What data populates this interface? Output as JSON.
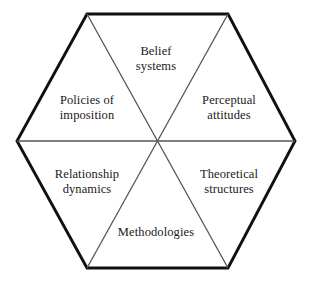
{
  "diagram": {
    "type": "hexagon-sector-diagram",
    "shape": "hexagon",
    "sector_count": 6,
    "background_color": "#ffffff",
    "outline_color": "#111111",
    "divider_color": "#555555",
    "text_color": "#1a1a1a",
    "geometry": {
      "center": {
        "x": 156,
        "y": 141
      },
      "vertices": [
        {
          "name": "top-left",
          "x": 87,
          "y": 14
        },
        {
          "name": "top-right",
          "x": 228,
          "y": 14
        },
        {
          "name": "right",
          "x": 295,
          "y": 141
        },
        {
          "name": "bottom-right",
          "x": 228,
          "y": 268
        },
        {
          "name": "bottom-left",
          "x": 87,
          "y": 268
        },
        {
          "name": "left",
          "x": 17,
          "y": 141
        }
      ]
    },
    "sectors": [
      {
        "id": "belief-systems",
        "position": "top",
        "label": "Belief\nsystems",
        "label_x": 156,
        "label_y": 58
      },
      {
        "id": "perceptual-attitudes",
        "position": "upper-right",
        "label": "Perceptual\nattitudes",
        "label_x": 229,
        "label_y": 107
      },
      {
        "id": "theoretical-structures",
        "position": "lower-right",
        "label": "Theoretical\nstructures",
        "label_x": 229,
        "label_y": 181
      },
      {
        "id": "methodologies",
        "position": "bottom",
        "label": "Methodologies",
        "label_x": 156,
        "label_y": 232
      },
      {
        "id": "relationship-dynamics",
        "position": "lower-left",
        "label": "Relationship\ndynamics",
        "label_x": 87,
        "label_y": 181
      },
      {
        "id": "policies-of-imposition",
        "position": "upper-left",
        "label": "Policies of\nimposition",
        "label_x": 87,
        "label_y": 107
      }
    ]
  }
}
